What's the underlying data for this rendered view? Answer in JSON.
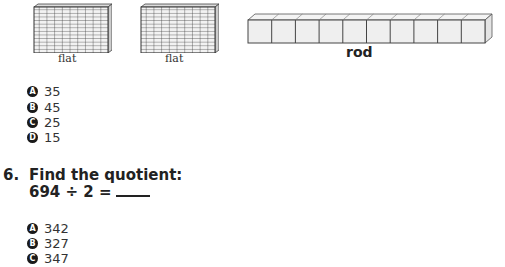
{
  "figures": {
    "flats": [
      {
        "label": "flat"
      },
      {
        "label": "flat"
      }
    ],
    "rod": {
      "label": "rod",
      "units": 10
    }
  },
  "question5_choices": [
    {
      "letter": "A",
      "text": "35"
    },
    {
      "letter": "B",
      "text": "45"
    },
    {
      "letter": "C",
      "text": "25"
    },
    {
      "letter": "D",
      "text": "15"
    }
  ],
  "question6": {
    "number": "6.",
    "prompt": "Find the quotient:",
    "expression": "694 ÷ 2 =",
    "choices": [
      {
        "letter": "A",
        "text": "342"
      },
      {
        "letter": "B",
        "text": "327"
      },
      {
        "letter": "C",
        "text": "347"
      }
    ]
  }
}
